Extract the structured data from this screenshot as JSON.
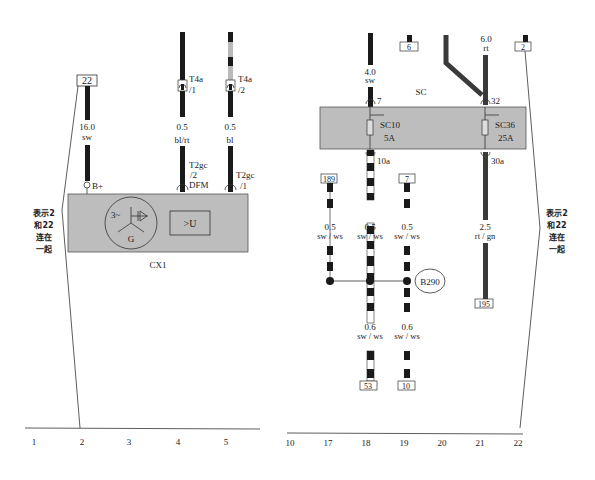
{
  "diagram": {
    "colors": {
      "wire_dark": "#1a1a1a",
      "wire_gray": "#3a3a3a",
      "wire_light": "#b9b9b9",
      "component_fill": "#bdbdbd",
      "line": "#333333"
    },
    "left": {
      "ref_box_22": "22",
      "wire_b": {
        "size": "16.0",
        "color": "sw",
        "pin": "B+"
      },
      "wire_dfm": {
        "connector": "T4a",
        "connector_pin": "/1",
        "size": "0.5",
        "color": "bl/rt",
        "plug": "T2gc",
        "plug_pin": "/2",
        "signal": "DFM"
      },
      "wire_t2": {
        "connector": "T4a",
        "connector_pin": "/2",
        "size": "0.5",
        "color": "bl",
        "plug": "T2gc",
        "plug_pin": "/1"
      },
      "component": {
        "id": "CX1",
        "generator_label": "G",
        "phase_label": "3~",
        "regulator_label": ">U"
      },
      "note": {
        "line1": "表示2",
        "line2": "和22",
        "line3": "连在",
        "line4": "一起"
      }
    },
    "right": {
      "ref_box_6": "6",
      "ref_box_2": "2",
      "wire_in_7": {
        "size": "4.0",
        "color": "sw",
        "pin": "7"
      },
      "wire_in_32": {
        "size": "6.0",
        "color": "rt",
        "pin": "32"
      },
      "fuse_box_label": "SC",
      "fuse_1": {
        "id": "SC10",
        "rating": "5A",
        "out_pin": "10a"
      },
      "fuse_2": {
        "id": "SC36",
        "rating": "25A",
        "out_pin": "30a"
      },
      "ref_box_189": "189",
      "ref_box_7": "7",
      "wires_mid": [
        {
          "size": "0.5",
          "color": "sw / ws"
        },
        {
          "size": "0.5",
          "color": "sw / ws"
        },
        {
          "size": "0.5",
          "color": "sw / ws"
        }
      ],
      "wire_30a": {
        "size": "2.5",
        "color": "rt / gn"
      },
      "ref_box_195": "195",
      "splice": "B290",
      "wires_low": [
        {
          "size": "0.6",
          "color": "sw / ws"
        },
        {
          "size": "0.6",
          "color": "sw / ws"
        }
      ],
      "ref_box_53": "53",
      "ref_box_10": "10",
      "note": {
        "line1": "表示2",
        "line2": "和22",
        "line3": "连在",
        "line4": "一起"
      }
    },
    "grid_left": [
      "1",
      "2",
      "3",
      "4",
      "5"
    ],
    "grid_right": [
      "10",
      "17",
      "18",
      "19",
      "20",
      "21",
      "22"
    ]
  }
}
